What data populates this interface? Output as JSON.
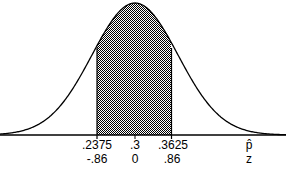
{
  "chart_data": {
    "type": "area",
    "title": "",
    "distribution": {
      "mean": 0.3,
      "sd_p_hat": 0.0727,
      "z_bounds": [
        -0.86,
        0.86
      ]
    },
    "shaded_region": {
      "p_hat_low": ".2375",
      "p_hat_high": ".3625",
      "z_low": "-.86",
      "z_high": ".86"
    },
    "axes": [
      {
        "name": "p-hat",
        "symbol": "p̂",
        "ticks": [
          ".2375",
          ".3",
          ".3625"
        ]
      },
      {
        "name": "z",
        "symbol": "z",
        "ticks": [
          "-.86",
          "0",
          ".86"
        ]
      }
    ],
    "colors": {
      "curve": "#000000",
      "shade": "#808080",
      "background": "#ffffff"
    }
  },
  "labels": {
    "phat_low": ".2375",
    "phat_mid": ".3",
    "phat_high": ".3625",
    "z_low": "-.86",
    "z_mid": "0",
    "z_high": ".86",
    "phat_symbol": "p̂",
    "z_symbol": "z"
  }
}
